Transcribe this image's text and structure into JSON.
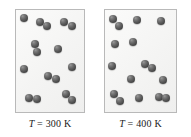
{
  "figure": {
    "title": "",
    "background_color": "#ffffff",
    "panel_border_color": "#b9b9b9",
    "panel_fill_color": "#f4f4f3",
    "atom_color": "#4c4c4c"
  },
  "panels": [
    {
      "id": "left-panel",
      "label_variable": "T",
      "label_equals": "=",
      "label_value": "300",
      "label_unit": "K",
      "label_text": "T = 300 K",
      "temperature_k": 300,
      "molecule_count": 13,
      "molecules": [
        {
          "atoms": [
            {
              "x": 4,
              "y": 4,
              "r": 8
            }
          ]
        },
        {
          "atoms": [
            {
              "x": 20,
              "y": 8,
              "r": 8
            },
            {
              "x": 27,
              "y": 12,
              "r": 8
            }
          ]
        },
        {
          "atoms": [
            {
              "x": 44,
              "y": 8,
              "r": 8
            },
            {
              "x": 52,
              "y": 12,
              "r": 8
            }
          ]
        },
        {
          "atoms": [
            {
              "x": 15,
              "y": 30,
              "r": 8
            },
            {
              "x": 17,
              "y": 38,
              "r": 8
            }
          ]
        },
        {
          "atoms": [
            {
              "x": 38,
              "y": 35,
              "r": 8
            }
          ]
        },
        {
          "atoms": [
            {
              "x": 4,
              "y": 55,
              "r": 8
            }
          ]
        },
        {
          "atoms": [
            {
              "x": 52,
              "y": 53,
              "r": 8
            }
          ]
        },
        {
          "atoms": [
            {
              "x": 28,
              "y": 62,
              "r": 8
            },
            {
              "x": 36,
              "y": 65,
              "r": 8
            }
          ]
        },
        {
          "atoms": [
            {
              "x": 9,
              "y": 84,
              "r": 8
            },
            {
              "x": 17,
              "y": 85,
              "r": 8
            }
          ]
        },
        {
          "atoms": [
            {
              "x": 46,
              "y": 80,
              "r": 8
            },
            {
              "x": 52,
              "y": 86,
              "r": 8
            }
          ]
        }
      ]
    },
    {
      "id": "right-panel",
      "label_variable": "T",
      "label_equals": "=",
      "label_value": "400",
      "label_unit": "K",
      "label_text": "T = 400 K",
      "temperature_k": 400,
      "molecule_count": 13,
      "molecules": [
        {
          "atoms": [
            {
              "x": 4,
              "y": 5,
              "r": 8
            },
            {
              "x": 10,
              "y": 12,
              "r": 8
            }
          ]
        },
        {
          "atoms": [
            {
              "x": 28,
              "y": 6,
              "r": 8
            }
          ]
        },
        {
          "atoms": [
            {
              "x": 52,
              "y": 7,
              "r": 8
            }
          ]
        },
        {
          "atoms": [
            {
              "x": 6,
              "y": 30,
              "r": 8
            }
          ]
        },
        {
          "atoms": [
            {
              "x": 24,
              "y": 28,
              "r": 8
            }
          ]
        },
        {
          "atoms": [
            {
              "x": 3,
              "y": 52,
              "r": 8
            }
          ]
        },
        {
          "atoms": [
            {
              "x": 36,
              "y": 50,
              "r": 8
            },
            {
              "x": 43,
              "y": 54,
              "r": 8
            }
          ]
        },
        {
          "atoms": [
            {
              "x": 22,
              "y": 65,
              "r": 8
            }
          ]
        },
        {
          "atoms": [
            {
              "x": 54,
              "y": 66,
              "r": 8
            }
          ]
        },
        {
          "atoms": [
            {
              "x": 5,
              "y": 80,
              "r": 8
            },
            {
              "x": 11,
              "y": 87,
              "r": 8
            }
          ]
        },
        {
          "atoms": [
            {
              "x": 30,
              "y": 84,
              "r": 8
            }
          ]
        },
        {
          "atoms": [
            {
              "x": 50,
              "y": 83,
              "r": 8
            },
            {
              "x": 57,
              "y": 84,
              "r": 8
            }
          ]
        }
      ]
    }
  ]
}
